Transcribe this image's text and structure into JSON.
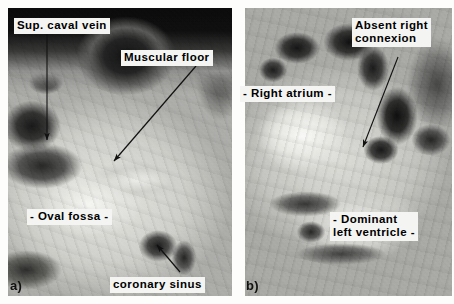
{
  "figure": {
    "background_color": "#ffffff",
    "panels": [
      {
        "tag": "a)",
        "subject": "Right atrium viewed from within, showing oval fossa and muscular floor",
        "labels": [
          {
            "id": "sup-caval-vein",
            "text": "Sup. caval vein",
            "lines": [
              "Sup. caval vein"
            ],
            "has_arrow": true,
            "arrow_direction": "down"
          },
          {
            "id": "muscular-floor",
            "text": "Muscular floor",
            "lines": [
              "Muscular floor"
            ],
            "has_arrow": true,
            "arrow_direction": "down-left"
          },
          {
            "id": "oval-fossa",
            "text": "- Oval fossa -",
            "lines": [
              "- Oval fossa -"
            ],
            "has_arrow": false,
            "arrow_direction": ""
          },
          {
            "id": "coronary-sinus",
            "text": "coronary sinus",
            "lines": [
              "coronary sinus"
            ],
            "has_arrow": true,
            "arrow_direction": "up-left"
          }
        ]
      },
      {
        "tag": "b)",
        "subject": "Absent right atrioventricular connexion with dominant left ventricle",
        "labels": [
          {
            "id": "absent-right-connexion",
            "text": "Absent right\nconnexion",
            "lines": [
              "Absent right",
              "connexion"
            ],
            "has_arrow": true,
            "arrow_direction": "down-left"
          },
          {
            "id": "right-atrium",
            "text": "- Right atrium -",
            "lines": [
              "- Right atrium -"
            ],
            "has_arrow": false,
            "arrow_direction": ""
          },
          {
            "id": "dominant-left-ventricle",
            "text": "- Dominant\nleft ventricle -",
            "lines": [
              "- Dominant",
              "left ventricle -"
            ],
            "has_arrow": false,
            "arrow_direction": ""
          }
        ]
      }
    ]
  },
  "colors": {
    "label_background": "#f4f4f2",
    "label_text": "#000000",
    "arrow": "#111111",
    "page_background": "#ffffff"
  }
}
